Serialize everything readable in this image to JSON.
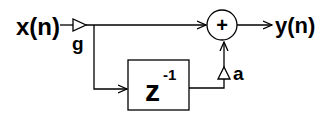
{
  "diagram": {
    "input_label": "x(n)",
    "output_label": "y(n)",
    "gain_g_label": "g",
    "gain_a_label": "a",
    "delay_label": "z",
    "delay_exponent": "-1",
    "sum_symbol": "+"
  }
}
